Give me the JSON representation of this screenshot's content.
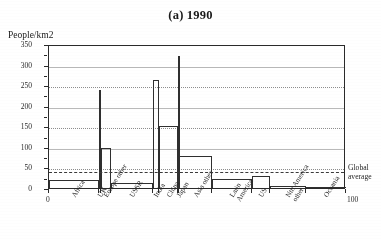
{
  "figure": {
    "title": "(a) 1990",
    "ylabel": "People/km2",
    "annotation_line1": "Global",
    "annotation_line2": "average",
    "x_start_label": "0",
    "x_end_label": "100"
  },
  "chart_data": {
    "type": "bar",
    "title": "(a) 1990",
    "xlabel": "",
    "ylabel": "People/km2",
    "ylim": [
      0,
      350
    ],
    "xlim": [
      0,
      100
    ],
    "grid": true,
    "legend": "none",
    "note": "Variable-width bar chart: bar width = share of world land area (cumulative 0-100%), bar height = population density in people per km2.",
    "yticks": [
      "0",
      "50",
      "100",
      "150",
      "200",
      "250",
      "300",
      "350"
    ],
    "ytick_values": [
      0,
      50,
      100,
      150,
      200,
      250,
      300,
      350
    ],
    "xticks": [
      "0",
      "100"
    ],
    "categories": [
      "Africa",
      "UK",
      "Europe other",
      "USSR",
      "India",
      "China",
      "Japan",
      "Asia other",
      "Latin America",
      "US",
      "Nth America other",
      "Oceania"
    ],
    "values": [
      20,
      238,
      97,
      13,
      263,
      150,
      320,
      78,
      22,
      28,
      5,
      3
    ],
    "widths": [
      17.0,
      0.6,
      3.4,
      14.0,
      2.0,
      6.5,
      0.4,
      11.0,
      13.5,
      6.0,
      12.0,
      13.6
    ],
    "annotations": [
      {
        "label": "Global average",
        "type": "hline",
        "value": 43
      }
    ]
  },
  "axis_labels": [
    {
      "text": "Africa",
      "lines": [
        "Africa"
      ]
    },
    {
      "text": "UK",
      "lines": [
        "UK"
      ]
    },
    {
      "text": "Europe other",
      "lines": [
        "Europe other"
      ]
    },
    {
      "text": "USSR",
      "lines": [
        "USSR"
      ]
    },
    {
      "text": "India",
      "lines": [
        "India"
      ]
    },
    {
      "text": "China",
      "lines": [
        "China"
      ]
    },
    {
      "text": "Japan",
      "lines": [
        "Japan"
      ]
    },
    {
      "text": "Asia other",
      "lines": [
        "Asia other"
      ]
    },
    {
      "text": "Latin America",
      "lines": [
        "Latin",
        "America"
      ]
    },
    {
      "text": "US",
      "lines": [
        "US"
      ]
    },
    {
      "text": "Nth America other",
      "lines": [
        "Nth America",
        "other"
      ]
    },
    {
      "text": "Oceania",
      "lines": [
        "Oceania"
      ]
    }
  ],
  "colors": {
    "ink": "#2a2a2a",
    "grid": "#8d8d8d",
    "paper": "#ffffff"
  }
}
